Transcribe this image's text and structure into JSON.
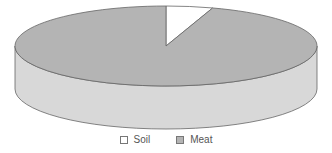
{
  "chart_data": {
    "type": "pie",
    "style": "3d",
    "title": "",
    "categories": [
      "Soil",
      "Meat"
    ],
    "values": [
      5,
      95
    ],
    "colors": [
      "#ffffff",
      "#b4b4b4"
    ],
    "side_color": "#d8d8d8",
    "legend_position": "bottom"
  },
  "legend": {
    "items": [
      {
        "label": "Soil",
        "color": "#ffffff"
      },
      {
        "label": "Meat",
        "color": "#b4b4b4"
      }
    ]
  }
}
